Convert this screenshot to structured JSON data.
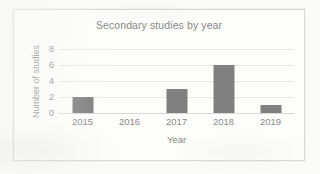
{
  "chart_data": {
    "type": "bar",
    "title": "Secondary studies by year",
    "xlabel": "Year",
    "ylabel": "Number of studies",
    "categories": [
      "2015",
      "2016",
      "2017",
      "2018",
      "2019"
    ],
    "values": [
      2,
      0,
      3,
      6,
      1
    ],
    "ylim": [
      0,
      8
    ],
    "yticks": [
      8,
      6,
      4,
      2,
      0
    ],
    "ytick_labels": [
      "8",
      "6",
      "4",
      "2",
      "0"
    ],
    "grid": true,
    "legend": false,
    "legend_position": "none",
    "series": [
      {
        "name": "Number of studies",
        "values": [
          2,
          0,
          3,
          6,
          1
        ]
      }
    ],
    "colors": {
      "bar": "#808080",
      "text": "#8a8a88",
      "title": "#888886",
      "gridline": "#e6e6e4",
      "axis": "#d8d8d6",
      "frame": "#d9d9d7",
      "plot_background": "#fdfdfc",
      "page_background": "#fbfbfa"
    }
  }
}
